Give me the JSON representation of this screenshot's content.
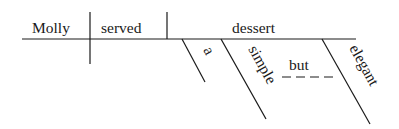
{
  "diagram": {
    "type": "sentence-diagram",
    "sentence": "Molly served a simple but elegant dessert",
    "subject": "Molly",
    "verb": "served",
    "direct_object": "dessert",
    "modifiers": {
      "article": "a",
      "adjective_1": "simple",
      "conjunction": "but",
      "adjective_2": "elegant"
    }
  }
}
